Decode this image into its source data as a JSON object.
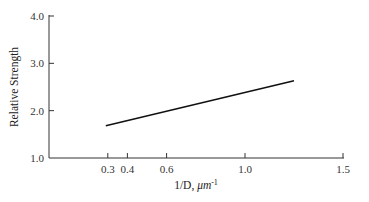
{
  "chart_data": {
    "type": "line",
    "title": "",
    "xlabel": "1/D, μm",
    "xlabel_superscript": "-1",
    "ylabel": "Relative Strength",
    "xlim": [
      0,
      1.5
    ],
    "ylim": [
      1.0,
      4.0
    ],
    "x_ticks": [
      0.3,
      0.4,
      0.6,
      1.0,
      1.5
    ],
    "x_tick_labels": [
      "0.3",
      "0.4",
      "0.6",
      "1.0",
      "1.5"
    ],
    "y_ticks": [
      1.0,
      2.0,
      3.0,
      4.0
    ],
    "y_tick_labels": [
      "1.0",
      "2.0",
      "3.0",
      "4.0"
    ],
    "grid": false,
    "legend": null,
    "series": [
      {
        "name": "Relative Strength vs 1/D",
        "x": [
          0.29,
          1.25
        ],
        "y": [
          1.68,
          2.63
        ]
      }
    ]
  }
}
